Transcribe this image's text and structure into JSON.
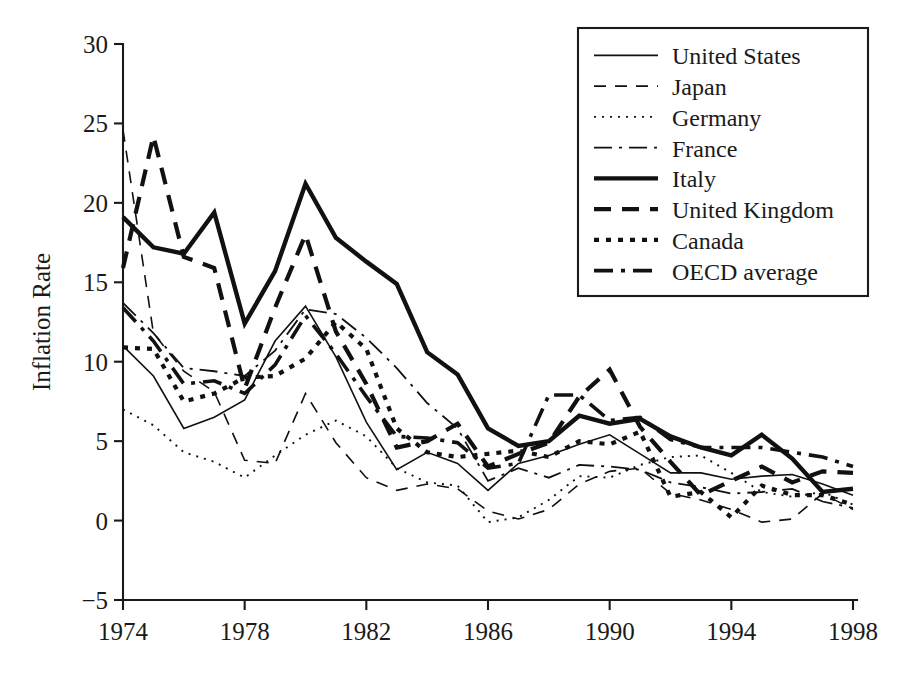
{
  "chart_data": {
    "type": "line",
    "title": "",
    "xlabel": "",
    "ylabel": "Inflation Rate",
    "xlim": [
      1974,
      1998
    ],
    "ylim": [
      -5,
      30
    ],
    "ytick_values": [
      -5,
      0,
      5,
      10,
      15,
      20,
      25,
      30
    ],
    "ytick_labels": [
      "−5",
      "0",
      "5",
      "10",
      "15",
      "20",
      "25",
      "30"
    ],
    "xtick_values": [
      1974,
      1978,
      1982,
      1986,
      1990,
      1994,
      1998
    ],
    "xtick_labels": [
      "1974",
      "1978",
      "1982",
      "1986",
      "1990",
      "1994",
      "1998"
    ],
    "grid": false,
    "legend_position": "top-right",
    "x": [
      1974,
      1975,
      1976,
      1977,
      1978,
      1979,
      1980,
      1981,
      1982,
      1983,
      1984,
      1985,
      1986,
      1987,
      1988,
      1989,
      1990,
      1991,
      1992,
      1993,
      1994,
      1995,
      1996,
      1997,
      1998
    ],
    "series": [
      {
        "name": "United States",
        "style": "solid-thin",
        "dash": "none",
        "width": 1.6,
        "values": [
          11.0,
          9.1,
          5.8,
          6.5,
          7.6,
          11.3,
          13.5,
          10.3,
          6.2,
          3.2,
          4.3,
          3.6,
          1.9,
          3.6,
          4.1,
          4.8,
          5.4,
          4.2,
          3.0,
          3.0,
          2.6,
          2.8,
          2.9,
          2.3,
          1.6
        ]
      },
      {
        "name": "Japan",
        "style": "dashed-thin",
        "dash": "12,9",
        "width": 1.6,
        "values": [
          24.6,
          11.8,
          9.4,
          8.1,
          3.8,
          3.6,
          8.0,
          4.9,
          2.7,
          1.9,
          2.3,
          2.0,
          0.6,
          0.1,
          0.7,
          2.3,
          3.1,
          3.3,
          1.7,
          1.3,
          0.7,
          -0.1,
          0.1,
          1.7,
          0.7
        ]
      },
      {
        "name": "Germany",
        "style": "dotted-thin",
        "dash": "2,6",
        "width": 1.9,
        "values": [
          7.0,
          6.0,
          4.3,
          3.7,
          2.7,
          4.1,
          5.4,
          6.3,
          5.3,
          3.3,
          2.4,
          2.2,
          -0.1,
          0.2,
          1.3,
          2.8,
          2.7,
          3.5,
          4.0,
          4.1,
          3.0,
          1.8,
          1.5,
          1.8,
          1.0
        ]
      },
      {
        "name": "France",
        "style": "dashdot-thin",
        "dash": "18,7,3,7",
        "width": 1.8,
        "values": [
          13.7,
          11.8,
          9.6,
          9.4,
          9.1,
          10.7,
          13.3,
          13.0,
          11.5,
          9.6,
          7.4,
          5.8,
          2.5,
          3.3,
          2.7,
          3.5,
          3.4,
          3.2,
          2.4,
          2.1,
          1.7,
          1.8,
          2.0,
          1.2,
          0.8
        ]
      },
      {
        "name": "Italy",
        "style": "solid-thick",
        "dash": "none",
        "width": 4.4,
        "values": [
          19.1,
          17.2,
          16.8,
          19.4,
          12.4,
          15.7,
          21.2,
          17.8,
          16.3,
          14.9,
          10.6,
          9.2,
          5.8,
          4.7,
          5.0,
          6.6,
          6.1,
          6.4,
          5.3,
          4.6,
          4.1,
          5.4,
          3.9,
          1.8,
          2.0
        ]
      },
      {
        "name": "United Kingdom",
        "style": "dashed-thick",
        "dash": "17,11",
        "width": 4.2,
        "values": [
          15.9,
          24.2,
          16.6,
          15.9,
          8.3,
          13.4,
          18.0,
          11.9,
          8.6,
          4.6,
          5.0,
          6.1,
          3.4,
          4.2,
          4.9,
          7.8,
          9.5,
          5.9,
          3.7,
          1.6,
          2.5,
          3.4,
          2.4,
          3.1,
          3.0
        ]
      },
      {
        "name": "Canada",
        "style": "dotted-thick",
        "dash": "5,7",
        "width": 4.2,
        "values": [
          10.9,
          10.8,
          7.5,
          8.0,
          9.0,
          9.1,
          10.2,
          12.5,
          10.8,
          5.8,
          4.3,
          4.0,
          4.2,
          4.4,
          4.0,
          5.0,
          4.8,
          5.6,
          1.5,
          1.8,
          0.2,
          2.2,
          1.6,
          1.6,
          1.0
        ]
      },
      {
        "name": "OECD average",
        "style": "dashdot-thick",
        "dash": "19,8,4,8",
        "width": 3.6,
        "values": [
          13.4,
          11.3,
          8.6,
          8.8,
          8.0,
          9.8,
          12.9,
          10.5,
          7.8,
          5.3,
          5.2,
          4.9,
          3.3,
          3.6,
          7.9,
          7.9,
          6.3,
          6.5,
          5.1,
          4.6,
          4.6,
          4.6,
          4.3,
          4.0,
          3.4
        ]
      }
    ]
  },
  "legend": {
    "items": [
      {
        "label": "United States"
      },
      {
        "label": "Japan"
      },
      {
        "label": "Germany"
      },
      {
        "label": "France"
      },
      {
        "label": "Italy"
      },
      {
        "label": "United Kingdom"
      },
      {
        "label": "Canada"
      },
      {
        "label": "OECD average"
      }
    ]
  },
  "colors": {
    "ink": "#111111",
    "background": "#ffffff"
  }
}
